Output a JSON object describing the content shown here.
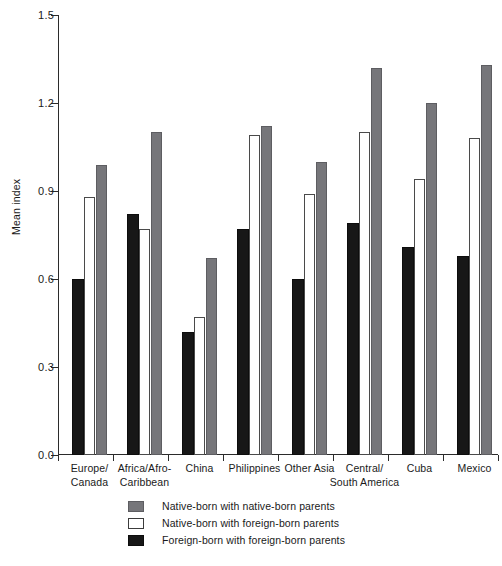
{
  "chart_data": {
    "type": "bar",
    "title": "",
    "xlabel": "",
    "ylabel": "Mean index",
    "ylim": [
      0.0,
      1.5
    ],
    "yticks": [
      "0.0",
      "0.3",
      "0.6",
      "0.9",
      "1.2",
      "1.5"
    ],
    "ytick_values": [
      0.0,
      0.3,
      0.6,
      0.9,
      1.2,
      1.5
    ],
    "grid": false,
    "legend_position": "bottom",
    "categories": [
      "Europe/\nCanada",
      "Africa/Afro-\nCaribbean",
      "China",
      "Philippines",
      "Other Asia",
      "Central/\nSouth America",
      "Cuba",
      "Mexico"
    ],
    "series": [
      {
        "name": "Native-born with native-born parents",
        "color": "#76767a",
        "style": "gray",
        "values": [
          0.99,
          1.1,
          0.67,
          1.12,
          1.0,
          1.32,
          1.2,
          1.33
        ]
      },
      {
        "name": "Native-born with foreign-born parents",
        "color": "#ffffff",
        "style": "white",
        "values": [
          0.88,
          0.77,
          0.47,
          1.09,
          0.89,
          1.1,
          0.94,
          1.08
        ]
      },
      {
        "name": "Foreign-born with foreign-born parents",
        "color": "#171717",
        "style": "black",
        "values": [
          0.6,
          0.82,
          0.42,
          0.77,
          0.6,
          0.79,
          0.71,
          0.68
        ]
      }
    ],
    "series_draw_order": [
      "black",
      "white",
      "gray"
    ]
  },
  "axis": {
    "y_title": "Mean index"
  },
  "legend": {
    "items": [
      {
        "label": "Native-born with native-born parents",
        "swatch": "gray"
      },
      {
        "label": "Native-born with foreign-born parents",
        "swatch": "white"
      },
      {
        "label": "Foreign-born with foreign-born parents",
        "swatch": "black"
      }
    ]
  }
}
